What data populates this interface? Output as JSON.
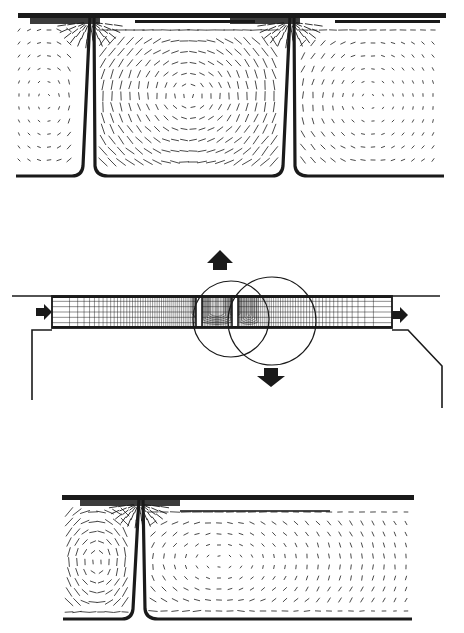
{
  "figure": {
    "width": 464,
    "height": 633,
    "background": "#ffffff",
    "ink": "#1a1a1a",
    "text_labels": []
  },
  "top_panel": {
    "description": "velocity vector field, two cavities separated by thin fins",
    "top_wall": {
      "x1": 18,
      "x2": 446,
      "y": 16
    },
    "bottom_y": 176,
    "fins": [
      {
        "x_top": 92,
        "x_bottom": 86
      },
      {
        "x_top": 292,
        "x_bottom": 286
      }
    ],
    "cavities": [
      {
        "x1": 14,
        "x2": 80,
        "type": "partial-left"
      },
      {
        "x1": 98,
        "x2": 282,
        "type": "full-recirculation"
      },
      {
        "x1": 298,
        "x2": 446,
        "type": "partial-right"
      }
    ]
  },
  "middle_panel": {
    "description": "computational mesh of channel with two slots and zoom circles",
    "channel": {
      "x1": 52,
      "x2": 392,
      "y_top": 296,
      "y_bottom": 328
    },
    "top_line": {
      "x1": 12,
      "x2": 440,
      "y": 296
    },
    "left_wall": {
      "x": 32,
      "y_top": 330,
      "y_bottom": 400
    },
    "right_wall": {
      "x_step": 408,
      "x_diag_end": 442,
      "y_step": 330,
      "y_diag_end": 366,
      "y_bottom": 408
    },
    "slots": [
      {
        "x1": 196,
        "x2": 202
      },
      {
        "x1": 232,
        "x2": 238
      }
    ],
    "circles": [
      {
        "cx": 231,
        "cy": 319,
        "r": 38
      },
      {
        "cx": 272,
        "cy": 321,
        "r": 44
      }
    ],
    "arrows": [
      {
        "name": "inlet-arrow",
        "dir": "right",
        "x": 36,
        "y": 312
      },
      {
        "name": "outlet-arrow",
        "dir": "right",
        "x": 392,
        "y": 315
      },
      {
        "name": "up-arrow",
        "dir": "up",
        "x": 220,
        "y": 258
      },
      {
        "name": "down-arrow",
        "dir": "down",
        "x": 271,
        "y": 376
      }
    ]
  },
  "bottom_panel": {
    "description": "velocity vector field, single fin near left",
    "top_wall": {
      "x1": 62,
      "x2": 414,
      "y": 498
    },
    "bottom_y": 619,
    "fin": {
      "x_top": 141,
      "x_bottom": 136
    }
  }
}
